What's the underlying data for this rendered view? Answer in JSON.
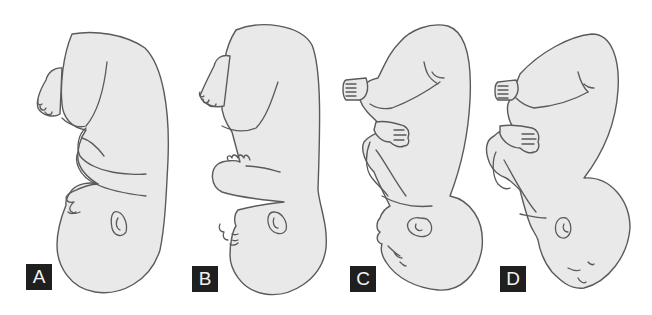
{
  "figure": {
    "panels": [
      {
        "id": "A",
        "label": "A"
      },
      {
        "id": "B",
        "label": "B"
      },
      {
        "id": "C",
        "label": "C"
      },
      {
        "id": "D",
        "label": "D"
      }
    ]
  },
  "colors": {
    "body_fill": "#e9e9e9",
    "outline": "#5a5a5a",
    "label_bg": "#1f1f1f",
    "label_text": "#f2f2f2",
    "background": "#ffffff"
  }
}
